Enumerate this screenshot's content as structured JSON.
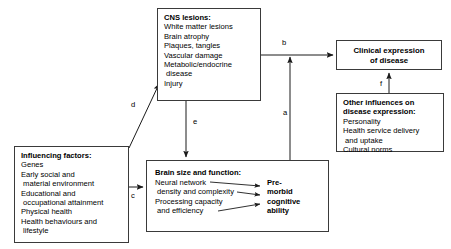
{
  "diagram": {
    "nodes": {
      "cns_lesions": {
        "title": "CNS lesions:",
        "lines": [
          "White matter lesions",
          "Brain atrophy",
          "Plaques, tangles",
          "Vascular damage",
          "Metabolic/endocrine",
          " disease",
          "Injury"
        ]
      },
      "clinical_expression": {
        "line1": "Clinical expression",
        "line2": "of disease"
      },
      "other_influences": {
        "title_line1": "Other influences on",
        "title_line2": "disease expression:",
        "lines": [
          "Personality",
          "Health service delivery",
          " and uptake",
          "Cultural norms"
        ]
      },
      "influencing_factors": {
        "title": "Influencing factors:",
        "lines": [
          "Genes",
          "Early social and",
          " material environment",
          "Educational and",
          " occupational attainment",
          "Physical health",
          "Health behaviours and",
          " lifestyle"
        ]
      },
      "brain_size_function": {
        "title": "Brain size and function:",
        "left_lines": [
          "Neural network",
          " density and complexity",
          "Processing capacity",
          " and efficiency"
        ],
        "right_lines": [
          "Pre-",
          "morbid",
          "cognitive",
          "ability"
        ]
      }
    },
    "edges": [
      {
        "id": "a",
        "label": "a",
        "from": "brain_size_function",
        "to": "clinical_expression"
      },
      {
        "id": "b",
        "label": "b",
        "from": "cns_lesions",
        "to": "clinical_expression"
      },
      {
        "id": "c",
        "label": "c",
        "from": "influencing_factors",
        "to": "brain_size_function"
      },
      {
        "id": "d",
        "label": "d",
        "from": "influencing_factors",
        "to": "cns_lesions"
      },
      {
        "id": "e",
        "label": "e",
        "from": "cns_lesions",
        "to": "brain_size_function"
      },
      {
        "id": "f",
        "label": "f",
        "from": "other_influences",
        "to": "clinical_expression"
      }
    ],
    "colors": {
      "stroke": "#3a3a3a",
      "arrow": "#1a1a1a",
      "text": "#000000",
      "background": "#ffffff"
    }
  }
}
